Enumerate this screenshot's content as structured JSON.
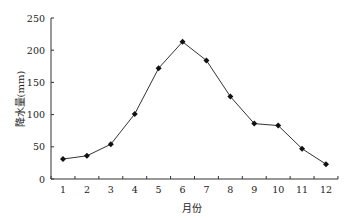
{
  "chart_data": {
    "type": "line",
    "title": "",
    "xlabel": "月份",
    "ylabel": "降水量(mm)",
    "categories": [
      "1",
      "2",
      "3",
      "4",
      "5",
      "6",
      "7",
      "8",
      "9",
      "10",
      "11",
      "12"
    ],
    "series": [
      {
        "name": "降水量",
        "values": [
          31,
          36,
          54,
          101,
          172,
          213,
          184,
          128,
          86,
          83,
          47,
          23
        ]
      }
    ],
    "ylim": [
      0,
      250
    ],
    "yticks": [
      "0",
      "50",
      "100",
      "150",
      "200",
      "250"
    ],
    "grid": false,
    "legend": "none",
    "marker": "diamond"
  }
}
